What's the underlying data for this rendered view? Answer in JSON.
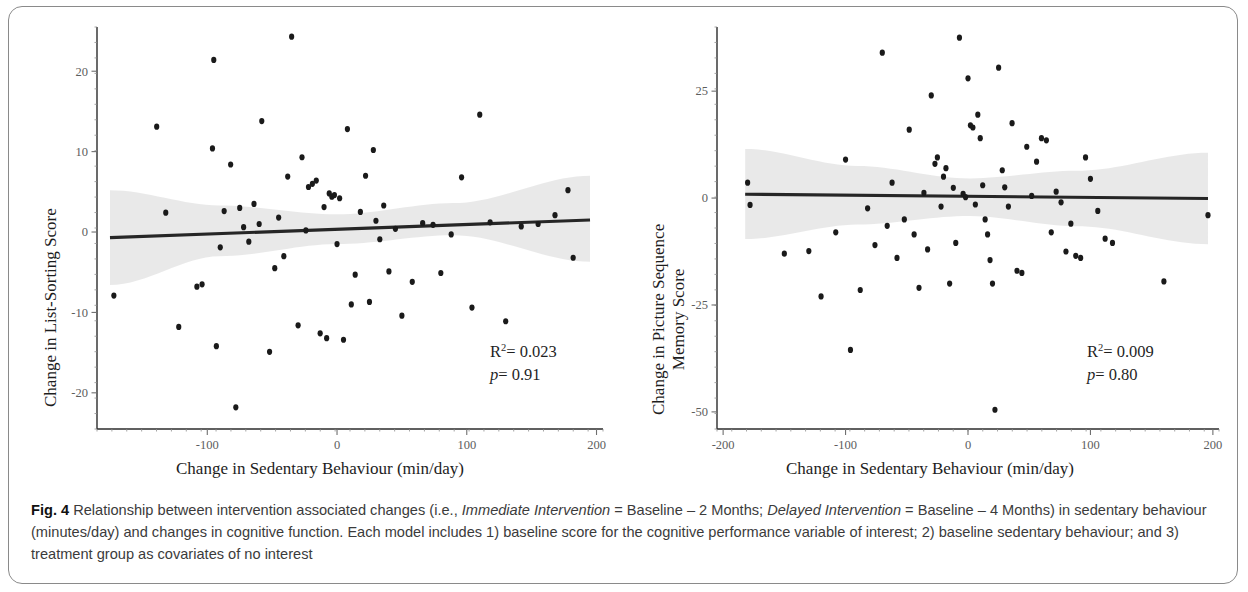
{
  "figure": {
    "label": "Fig. 4",
    "caption_text": " Relationship between intervention associated changes (i.e., ",
    "caption_em1": "Immediate Intervention",
    "caption_text2": " = Baseline – 2 Months; ",
    "caption_em2": "Delayed Intervention",
    "caption_text3": " = Baseline – 4 Months) in sedentary behaviour (minutes/day) and changes in cognitive function. Each model includes 1) baseline score for the cognitive performance variable of interest; 2) baseline sedentary behaviour; and 3) treatment group as covariates of no interest"
  },
  "chart_data": [
    {
      "type": "scatter",
      "panel": "left",
      "title": "",
      "xlabel": "Change in Sedentary Behaviour (min/day)",
      "ylabel": "Change in List-Sorting Score",
      "xlim": [
        -185,
        205
      ],
      "ylim": [
        -24.5,
        25.5
      ],
      "xticks": [
        -100,
        0,
        100,
        200
      ],
      "yticks": [
        20,
        10,
        0,
        -10,
        -20
      ],
      "xticklabels": [
        "-100",
        "0",
        "100",
        "200"
      ],
      "yticklabels": [
        "20",
        "10",
        "0",
        "-10",
        "-20"
      ],
      "grid": false,
      "legend": "none",
      "annotations": {
        "r_squared_label": "R",
        "r_squared_exp": "2",
        "r_squared_value": "= 0.023",
        "p_label": "p",
        "p_value": "= 0.91"
      },
      "fit_line": {
        "x": [
          -175,
          195
        ],
        "y": [
          -0.7,
          1.5
        ],
        "color": "#262626"
      },
      "ci_band": {
        "x": [
          -175,
          -90,
          0,
          90,
          195
        ],
        "upper": [
          5.2,
          3.3,
          2.2,
          3.6,
          7.0
        ],
        "lower": [
          -6.6,
          -3.0,
          -1.5,
          -0.4,
          -3.7
        ],
        "color": "#000000",
        "opacity": 0.085
      },
      "points": [
        [
          -172,
          -7.9
        ],
        [
          -139,
          13.1
        ],
        [
          -132,
          2.4
        ],
        [
          -122,
          -11.8
        ],
        [
          -108,
          -6.8
        ],
        [
          -104,
          -6.5
        ],
        [
          -96,
          10.4
        ],
        [
          -95,
          21.4
        ],
        [
          -93,
          -14.2
        ],
        [
          -90,
          -1.9
        ],
        [
          -87,
          2.6
        ],
        [
          -82,
          8.4
        ],
        [
          -78,
          -21.8
        ],
        [
          -75,
          3.0
        ],
        [
          -72,
          0.6
        ],
        [
          -68,
          -1.2
        ],
        [
          -64,
          3.5
        ],
        [
          -60,
          1.0
        ],
        [
          -58,
          13.8
        ],
        [
          -52,
          -14.9
        ],
        [
          -48,
          -4.5
        ],
        [
          -45,
          1.8
        ],
        [
          -41,
          -3.0
        ],
        [
          -38,
          6.9
        ],
        [
          -35,
          24.3
        ],
        [
          -30,
          -11.6
        ],
        [
          -27,
          9.3
        ],
        [
          -24,
          0.2
        ],
        [
          -22,
          5.6
        ],
        [
          -19,
          6.0
        ],
        [
          -16,
          6.4
        ],
        [
          -13,
          -12.6
        ],
        [
          -10,
          3.1
        ],
        [
          -8,
          -13.2
        ],
        [
          -6,
          4.8
        ],
        [
          -4,
          4.4
        ],
        [
          -2,
          4.6
        ],
        [
          0,
          -1.5
        ],
        [
          2,
          4.2
        ],
        [
          5,
          -13.4
        ],
        [
          8,
          12.8
        ],
        [
          11,
          -9.0
        ],
        [
          14,
          -5.3
        ],
        [
          18,
          2.5
        ],
        [
          22,
          7.0
        ],
        [
          25,
          -8.7
        ],
        [
          28,
          10.2
        ],
        [
          30,
          1.4
        ],
        [
          33,
          -0.9
        ],
        [
          36,
          3.3
        ],
        [
          40,
          -4.9
        ],
        [
          45,
          0.4
        ],
        [
          50,
          -10.4
        ],
        [
          58,
          -6.2
        ],
        [
          66,
          1.1
        ],
        [
          74,
          0.9
        ],
        [
          80,
          -5.1
        ],
        [
          88,
          -0.3
        ],
        [
          96,
          6.8
        ],
        [
          104,
          -9.4
        ],
        [
          110,
          14.6
        ],
        [
          118,
          1.2
        ],
        [
          130,
          -11.1
        ],
        [
          142,
          0.7
        ],
        [
          155,
          1.0
        ],
        [
          168,
          2.1
        ],
        [
          178,
          5.2
        ],
        [
          182,
          -3.2
        ]
      ]
    },
    {
      "type": "scatter",
      "panel": "right",
      "title": "",
      "xlabel": "Change in Sedentary Behaviour (min/day)",
      "ylabel_line1": "Change in Picture Sequence",
      "ylabel_line2": "Memory Score",
      "xlim": [
        -205,
        205
      ],
      "ylim": [
        -54,
        40
      ],
      "xticks": [
        -200,
        -100,
        0,
        100,
        200
      ],
      "yticks": [
        25,
        0,
        -25,
        -50
      ],
      "xticklabels": [
        "-200",
        "-100",
        "0",
        "100",
        "200"
      ],
      "yticklabels": [
        "25",
        "0",
        "-25",
        "-50"
      ],
      "grid": false,
      "legend": "none",
      "annotations": {
        "r_squared_label": "R",
        "r_squared_exp": "2",
        "r_squared_value": "= 0.009",
        "p_label": "p",
        "p_value": "= 0.80"
      },
      "fit_line": {
        "x": [
          -182,
          196
        ],
        "y": [
          0.9,
          -0.1
        ],
        "color": "#262626"
      },
      "ci_band": {
        "x": [
          -182,
          -90,
          0,
          90,
          196
        ],
        "upper": [
          11.5,
          7.5,
          4.6,
          6.4,
          10.6
        ],
        "lower": [
          -9.6,
          -6.2,
          -4.2,
          -6.6,
          -10.8
        ],
        "color": "#000000",
        "opacity": 0.085
      },
      "points": [
        [
          -180,
          3.6
        ],
        [
          -178,
          -1.6
        ],
        [
          -150,
          -13.0
        ],
        [
          -130,
          -12.4
        ],
        [
          -120,
          -23.0
        ],
        [
          -108,
          -8.0
        ],
        [
          -100,
          9.0
        ],
        [
          -96,
          -35.5
        ],
        [
          -88,
          -21.5
        ],
        [
          -82,
          -2.4
        ],
        [
          -76,
          -11.0
        ],
        [
          -70,
          34.0
        ],
        [
          -66,
          -6.5
        ],
        [
          -62,
          3.6
        ],
        [
          -58,
          -14.0
        ],
        [
          -52,
          -5.0
        ],
        [
          -48,
          16.0
        ],
        [
          -44,
          -8.5
        ],
        [
          -40,
          -21.0
        ],
        [
          -36,
          1.2
        ],
        [
          -33,
          -12.0
        ],
        [
          -30,
          24.0
        ],
        [
          -27,
          8.0
        ],
        [
          -25,
          9.5
        ],
        [
          -22,
          -2.0
        ],
        [
          -20,
          5.0
        ],
        [
          -18,
          7.0
        ],
        [
          -15,
          -20.0
        ],
        [
          -12,
          2.4
        ],
        [
          -10,
          -10.5
        ],
        [
          -7,
          37.5
        ],
        [
          -4,
          1.0
        ],
        [
          -2,
          0.2
        ],
        [
          0,
          28.0
        ],
        [
          2,
          17.0
        ],
        [
          4,
          16.5
        ],
        [
          6,
          -1.5
        ],
        [
          8,
          19.5
        ],
        [
          10,
          14.0
        ],
        [
          12,
          3.0
        ],
        [
          14,
          -5.0
        ],
        [
          16,
          -8.5
        ],
        [
          18,
          -14.5
        ],
        [
          20,
          -20.0
        ],
        [
          22,
          -49.5
        ],
        [
          25,
          30.5
        ],
        [
          28,
          6.5
        ],
        [
          30,
          2.5
        ],
        [
          33,
          -2.0
        ],
        [
          36,
          17.5
        ],
        [
          40,
          -17.0
        ],
        [
          44,
          -17.5
        ],
        [
          48,
          12.0
        ],
        [
          52,
          0.5
        ],
        [
          56,
          8.5
        ],
        [
          60,
          14.0
        ],
        [
          64,
          13.5
        ],
        [
          68,
          -8.0
        ],
        [
          72,
          1.5
        ],
        [
          76,
          -1.0
        ],
        [
          80,
          -12.5
        ],
        [
          84,
          -6.0
        ],
        [
          88,
          -13.5
        ],
        [
          92,
          -14.0
        ],
        [
          96,
          9.5
        ],
        [
          100,
          4.5
        ],
        [
          106,
          -3.0
        ],
        [
          112,
          -9.5
        ],
        [
          118,
          -10.5
        ],
        [
          160,
          -19.5
        ],
        [
          196,
          -4.0
        ]
      ]
    }
  ]
}
